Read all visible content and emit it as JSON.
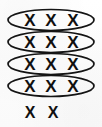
{
  "figure": {
    "background_color": "#ffffff",
    "ink_color": "#141414",
    "mark_glyph": "X",
    "total_marks": 14,
    "marks_per_group": 3,
    "group_count": 4,
    "remainder_count": 2
  },
  "groups": [
    {
      "id": "group-1",
      "label": "Group 1",
      "marks": [
        "X",
        "X",
        "X"
      ],
      "count": 3,
      "circled": true,
      "ellipse": {
        "cx": 51,
        "cy": 20,
        "rx": 43,
        "ry": 10.5
      },
      "mark_x": [
        30,
        51,
        73
      ],
      "mark_y": 20
    },
    {
      "id": "group-2",
      "label": "Group 2",
      "marks": [
        "X",
        "X",
        "X"
      ],
      "count": 3,
      "circled": true,
      "ellipse": {
        "cx": 51,
        "cy": 42,
        "rx": 43,
        "ry": 10.5
      },
      "mark_x": [
        30,
        51,
        73
      ],
      "mark_y": 42
    },
    {
      "id": "group-3",
      "label": "Group 3",
      "marks": [
        "X",
        "X",
        "X"
      ],
      "count": 3,
      "circled": true,
      "ellipse": {
        "cx": 51,
        "cy": 64,
        "rx": 43,
        "ry": 10.5
      },
      "mark_x": [
        30,
        51,
        73
      ],
      "mark_y": 64
    },
    {
      "id": "group-4",
      "label": "Group 4",
      "marks": [
        "X",
        "X",
        "X"
      ],
      "count": 3,
      "circled": true,
      "ellipse": {
        "cx": 51,
        "cy": 86,
        "rx": 43,
        "ry": 10.5
      },
      "mark_x": [
        30,
        51,
        73
      ],
      "mark_y": 86
    }
  ],
  "remainder": {
    "id": "remainder",
    "label": "Remainder",
    "marks": [
      "X",
      "X"
    ],
    "count": 2,
    "circled": false,
    "mark_x": [
      30,
      53
    ],
    "mark_y": 112
  },
  "marks": {
    "g1m1": "X",
    "g1m2": "X",
    "g1m3": "X",
    "g2m1": "X",
    "g2m2": "X",
    "g2m3": "X",
    "g3m1": "X",
    "g3m2": "X",
    "g3m3": "X",
    "g4m1": "X",
    "g4m2": "X",
    "g4m3": "X",
    "r1": "X",
    "r2": "X"
  }
}
